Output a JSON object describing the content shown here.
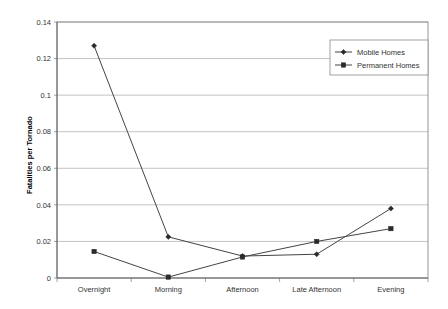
{
  "chart_data": {
    "type": "line",
    "title": "",
    "xlabel": "",
    "ylabel": "Fatalities per Tornado",
    "categories": [
      "Overnight",
      "Morning",
      "Afternoon",
      "Late Afternoon",
      "Evening"
    ],
    "ylim": [
      0,
      0.14
    ],
    "ytick_labels": [
      "0",
      "0.02",
      "0.04",
      "0.06",
      "0.08",
      "0.1",
      "0.12",
      "0.14"
    ],
    "ytick_values": [
      0,
      0.02,
      0.04,
      0.06,
      0.08,
      0.1,
      0.12,
      0.14
    ],
    "grid": true,
    "legend_position": "upper-right",
    "series": [
      {
        "name": "Mobile Homes",
        "marker": "diamond",
        "color": "#2a2a2a",
        "values": [
          0.127,
          0.0225,
          0.012,
          0.013,
          0.038
        ]
      },
      {
        "name": "Permanent Homes",
        "marker": "square",
        "color": "#2a2a2a",
        "values": [
          0.0145,
          0.0005,
          0.0115,
          0.02,
          0.027
        ]
      }
    ]
  },
  "legend": {
    "entries": [
      {
        "label": "Mobile Homes"
      },
      {
        "label": "Permanent Homes"
      }
    ]
  },
  "axes": {
    "y_title": "Fatalities per Tornado"
  }
}
